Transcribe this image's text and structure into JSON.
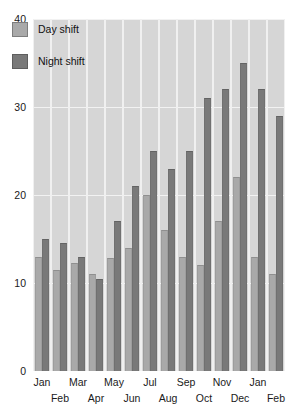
{
  "chart_data": {
    "type": "bar",
    "title": "",
    "xlabel": "",
    "ylabel": "",
    "ylim": [
      0,
      40
    ],
    "yticks": [
      0,
      10,
      20,
      30,
      40
    ],
    "ytick_labels": [
      "0",
      "10",
      "20",
      "30",
      "40"
    ],
    "grid": true,
    "legend_position": "top-left",
    "categories": [
      "Jan",
      "Feb",
      "Mar",
      "Apr",
      "May",
      "Jun",
      "Jul",
      "Aug",
      "Sep",
      "Oct",
      "Nov",
      "Dec",
      "Jan",
      "Feb"
    ],
    "series": [
      {
        "name": "Day shift",
        "color": "#a9a9a9",
        "values": [
          13,
          11.5,
          12.3,
          11,
          12.8,
          14,
          20,
          16,
          13,
          12,
          17,
          22,
          13,
          11
        ]
      },
      {
        "name": "Night shift",
        "color": "#797979",
        "values": [
          15,
          14.5,
          13,
          10.5,
          17,
          21,
          25,
          23,
          25,
          31,
          32,
          35,
          32,
          29
        ]
      }
    ]
  },
  "legend": {
    "items": [
      {
        "label": "Day shift",
        "swatch": "day-shift-swatch"
      },
      {
        "label": "Night shift",
        "swatch": "night-shift-swatch"
      }
    ]
  },
  "colors": {
    "plot_background": "#d6d6d6",
    "gridline": "#f2f2f2",
    "day_shift": "#a9a9a9",
    "night_shift": "#797979",
    "text": "#1a1a1a",
    "page_background": "#ffffff"
  }
}
